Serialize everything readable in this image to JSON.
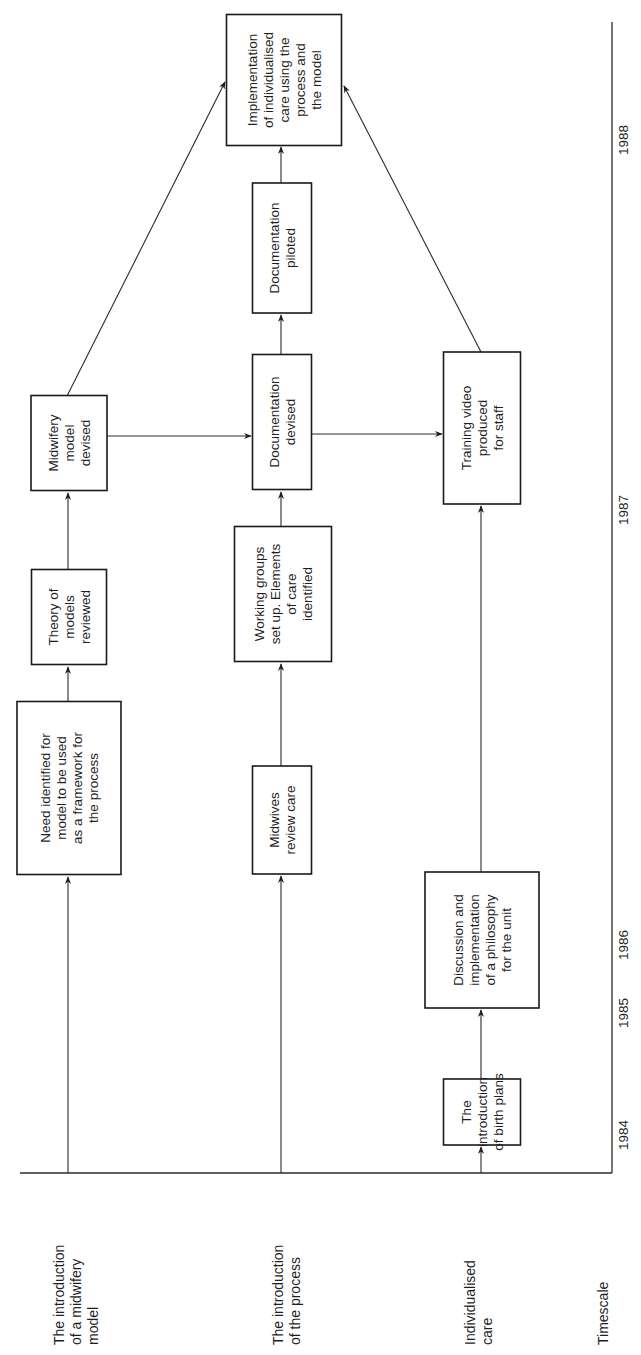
{
  "diagram": {
    "orientation": "rotated -90deg (reads bottom-to-top)",
    "colors": {
      "ink": "#1e1e1e",
      "background": "#ffffff"
    },
    "row_labels": [
      {
        "id": "row-midwifery-model",
        "lines": [
          "The introduction",
          "of a midwifery",
          "model"
        ]
      },
      {
        "id": "row-process",
        "lines": [
          "The introduction",
          "of the process"
        ]
      },
      {
        "id": "row-individualised-care",
        "lines": [
          "Individualised",
          "care"
        ]
      },
      {
        "id": "row-timescale",
        "lines": [
          "Timescale"
        ]
      }
    ],
    "timescale": {
      "years": [
        "1984",
        "1985",
        "1986",
        "1987",
        "1988"
      ]
    },
    "boxes": [
      {
        "id": "need-identified",
        "lines": [
          "Need identified for",
          "model to be used",
          "as a framework for",
          "the process"
        ]
      },
      {
        "id": "theory-of-models",
        "lines": [
          "Theory of",
          "models",
          "reviewed"
        ]
      },
      {
        "id": "midwifery-model-devised",
        "lines": [
          "Midwifery",
          "model",
          "devised"
        ]
      },
      {
        "id": "midwives-review-care",
        "lines": [
          "Midwives",
          "review care"
        ]
      },
      {
        "id": "working-groups",
        "lines": [
          "Working groups",
          "set up. Elements",
          "of care",
          "identified"
        ]
      },
      {
        "id": "documentation-devised",
        "lines": [
          "Documentation",
          "devised"
        ]
      },
      {
        "id": "documentation-piloted",
        "lines": [
          "Documentation",
          "piloted"
        ]
      },
      {
        "id": "implementation",
        "lines": [
          "Implementation",
          "of individualised",
          "care using the",
          "process and",
          "the model"
        ]
      },
      {
        "id": "birth-plans",
        "lines": [
          "The",
          "introduction",
          "of birth plans"
        ]
      },
      {
        "id": "discussion-philosophy",
        "lines": [
          "Discussion and",
          "implementation",
          "of a philosophy",
          "for the unit"
        ]
      },
      {
        "id": "training-video",
        "lines": [
          "Training video",
          "produced",
          "for staff"
        ]
      }
    ],
    "connections": [
      {
        "from": "row-midwifery-model",
        "to": "need-identified"
      },
      {
        "from": "need-identified",
        "to": "theory-of-models"
      },
      {
        "from": "theory-of-models",
        "to": "midwifery-model-devised"
      },
      {
        "from": "midwifery-model-devised",
        "to": "documentation-devised"
      },
      {
        "from": "midwifery-model-devised",
        "to": "implementation"
      },
      {
        "from": "row-process",
        "to": "midwives-review-care"
      },
      {
        "from": "midwives-review-care",
        "to": "working-groups"
      },
      {
        "from": "working-groups",
        "to": "documentation-devised"
      },
      {
        "from": "documentation-devised",
        "to": "documentation-piloted"
      },
      {
        "from": "documentation-devised",
        "to": "training-video"
      },
      {
        "from": "documentation-piloted",
        "to": "implementation"
      },
      {
        "from": "row-individualised-care",
        "to": "birth-plans"
      },
      {
        "from": "birth-plans",
        "to": "discussion-philosophy"
      },
      {
        "from": "discussion-philosophy",
        "to": "training-video"
      },
      {
        "from": "training-video",
        "to": "implementation"
      }
    ]
  }
}
